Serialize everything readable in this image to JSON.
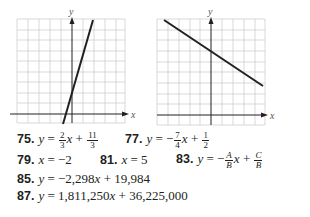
{
  "graphs": [
    {
      "id": "graph-75",
      "x_label": "x",
      "y_label": "y",
      "grid": {
        "cols": 10,
        "rows": 10
      },
      "line_color": "#231f20",
      "grid_color": "#c8c8c8"
    },
    {
      "id": "graph-77",
      "x_label": "x",
      "y_label": "y",
      "grid": {
        "cols": 10,
        "rows": 10
      },
      "line_color": "#231f20",
      "grid_color": "#c8c8c8"
    }
  ],
  "answers": {
    "a75": {
      "num": "75.",
      "lhs": "y",
      "eq": " = ",
      "coef_num": "2",
      "coef_den": "3",
      "var": "x",
      "op": " + ",
      "const_num": "11",
      "const_den": "3"
    },
    "a77": {
      "num": "77.",
      "lhs": "y",
      "eq": " = −",
      "coef_num": "7",
      "coef_den": "4",
      "var": "x",
      "op": " + ",
      "const_num": "1",
      "const_den": "2"
    },
    "a79": {
      "num": "79.",
      "lhs": "x",
      "rhs": " = −2"
    },
    "a81": {
      "num": "81.",
      "lhs": "x",
      "rhs": " = 5"
    },
    "a83": {
      "num": "83.",
      "lhs": "y",
      "eq": " = −",
      "coef_num": "A",
      "coef_den": "B",
      "var": "x",
      "op": " + ",
      "const_num": "C",
      "const_den": "B"
    },
    "a85": {
      "num": "85.",
      "lhs": "y",
      "eq": " = −2,298",
      "var": "x",
      "rest": " + 19,984"
    },
    "a87": {
      "num": "87.",
      "lhs": "y",
      "eq": " = 1,811,250",
      "var": "x",
      "rest": " + 36,225,000"
    }
  }
}
